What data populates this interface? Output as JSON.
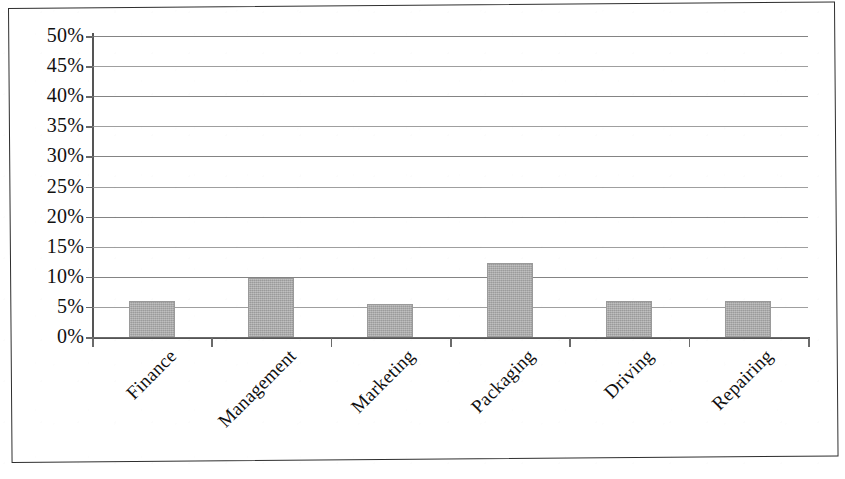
{
  "chart_data": {
    "type": "bar",
    "title": "",
    "subtitle": "",
    "xlabel": "",
    "ylabel": "",
    "categories": [
      "Finance",
      "Management",
      "Marketing",
      "Packaging",
      "Driving",
      "Repairing"
    ],
    "values": [
      6,
      9.8,
      5.5,
      12.3,
      6,
      6
    ],
    "value_labels": [
      "6%",
      "9.8%",
      "5.5%",
      "12.3%",
      "6%",
      "6%"
    ],
    "series": [
      {
        "name": "",
        "values": [
          6,
          9.8,
          5.5,
          12.3,
          6,
          6
        ]
      }
    ],
    "ylim": [
      0,
      50
    ],
    "ytick_step": 5,
    "ytick_labels": [
      "0%",
      "5%",
      "10%",
      "15%",
      "20%",
      "25%",
      "30%",
      "35%",
      "40%",
      "45%",
      "50%"
    ],
    "ytick_values": [
      0,
      5,
      10,
      15,
      20,
      25,
      30,
      35,
      40,
      45,
      50
    ],
    "grid": true,
    "grid_axis": "y",
    "legend": false,
    "legend_position": "none",
    "bar_color": "#a9a9a9",
    "bar_border_color": "#9a9a9a",
    "gridline_color": "#8e8e8e",
    "axis_color": "#555555",
    "text_color": "#111111",
    "background_color": "#ffffff",
    "xlabel_rotation": -45
  },
  "frame": {
    "border_color": "#2e2e2e"
  }
}
